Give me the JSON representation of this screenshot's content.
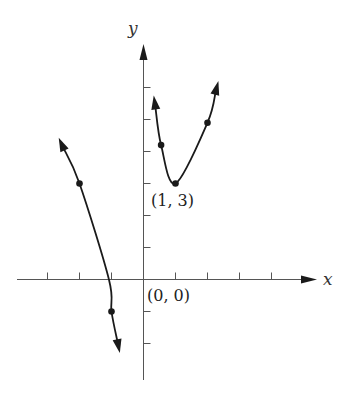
{
  "chart_data": {
    "type": "line",
    "title": "",
    "xlabel": "x",
    "ylabel": "y",
    "xlim": [
      -4,
      5
    ],
    "ylim": [
      -3,
      7
    ],
    "grid": false,
    "x_ticks": [
      -3,
      -2,
      -1,
      1,
      2,
      3,
      4
    ],
    "y_ticks": [
      -2,
      -1,
      1,
      2,
      3,
      4,
      5,
      6
    ],
    "series": [
      {
        "name": "left-branch",
        "description": "decreasing curve with arrows at both ends",
        "points": [
          {
            "x": -2.65,
            "y": 4.43,
            "kind": "arrow-end"
          },
          {
            "x": -2,
            "y": 3,
            "kind": "dot"
          },
          {
            "x": -1.08,
            "y": 0,
            "kind": "curve"
          },
          {
            "x": -1,
            "y": -1,
            "kind": "dot"
          },
          {
            "x": -0.74,
            "y": -2.3,
            "kind": "arrow-end"
          }
        ]
      },
      {
        "name": "right-branch",
        "description": "U-shaped curve with minimum at (1, 3), arrows at both ends",
        "points": [
          {
            "x": 0.32,
            "y": 5.75,
            "kind": "arrow-end"
          },
          {
            "x": 0.55,
            "y": 4.2,
            "kind": "dot"
          },
          {
            "x": 1,
            "y": 3,
            "kind": "dot"
          },
          {
            "x": 2,
            "y": 4.9,
            "kind": "dot"
          },
          {
            "x": 2.34,
            "y": 6.2,
            "kind": "arrow-end"
          }
        ]
      }
    ],
    "annotations": [
      {
        "text": "(1, 3)",
        "x": 1,
        "y": 3,
        "position": "below-right"
      },
      {
        "text": "(0, 0)",
        "x": 0,
        "y": 0,
        "position": "below-right"
      }
    ]
  },
  "labels": {
    "x_axis": "x",
    "y_axis": "y",
    "vertex": "(1, 3)",
    "origin": "(0, 0)"
  },
  "colors": {
    "axis": "#555555",
    "curve": "#1a1a1a",
    "background": "#ffffff"
  }
}
